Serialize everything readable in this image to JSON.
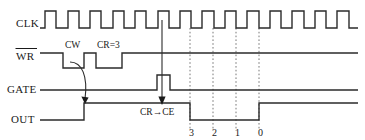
{
  "figure": {
    "kind": "timing-diagram",
    "background_color": "#ffffff",
    "line_color": "#2b2b2b",
    "text_color": "#1a1a1a",
    "gridline_color": "#555555"
  },
  "signals": {
    "clk": {
      "label": "CLK",
      "has_overbar": false
    },
    "wr": {
      "label": "WR",
      "has_overbar": true
    },
    "gate": {
      "label": "GATE",
      "has_overbar": false
    },
    "out": {
      "label": "OUT",
      "has_overbar": false
    }
  },
  "annotations": {
    "cw": "CW",
    "cr": "CR=3",
    "transfer": "CR→CE"
  },
  "countdown": {
    "values": [
      "3",
      "2",
      "1",
      "0"
    ]
  },
  "chart_data": {
    "type": "line",
    "xlabel": "",
    "ylabel": "",
    "xlim": [
      40,
      358
    ],
    "grid": true,
    "legend": "none",
    "gridlines_x": [
      190,
      213,
      236,
      259
    ],
    "series": [
      {
        "name": "CLK",
        "low_y": 28,
        "high_y": 11,
        "points": "40,28 45,28 45,11 56,11 56,28 68,28 68,11 79,11 79,28 90,28 90,11 101,11 101,28 113,28 113,11 124,11 124,28 135,28 135,11 146,11 146,28 158,28 158,11 169,11 169,28 180,28 180,11 191,11 191,28 202,28 202,11 214,11 214,28 225,28 225,11 236,11 236,28 247,28 247,11 259,11 259,28 270,28 270,11 281,11 281,28 292,28 292,11 304,11 304,28 315,28 315,11 326,11 326,28 337,28 337,11 349,11 349,28 358,28"
      },
      {
        "name": "WR",
        "low_y": 68,
        "high_y": 53,
        "points": "40,53 63,53 63,68 84,68 84,53 96,53 96,68 122,68 122,53 358,53"
      },
      {
        "name": "GATE",
        "low_y": 90,
        "high_y": 75,
        "points": "40,90 157,90 157,75 170,75 170,90 358,90"
      },
      {
        "name": "OUT",
        "low_y": 120,
        "high_y": 103,
        "points": "40,120 84,120 84,103 190,103 190,120 259,120 259,103 358,103"
      }
    ],
    "annotations": [
      {
        "text": "CW",
        "x": 73,
        "y": 48
      },
      {
        "text": "CR=3",
        "x": 110,
        "y": 48
      },
      {
        "text": "CR→CE",
        "x": 172,
        "y": 113
      },
      {
        "text": "3",
        "x": 192,
        "y": 133
      },
      {
        "text": "2",
        "x": 215,
        "y": 133
      },
      {
        "text": "1",
        "x": 238,
        "y": 133
      },
      {
        "text": "0",
        "x": 261,
        "y": 133
      }
    ]
  }
}
